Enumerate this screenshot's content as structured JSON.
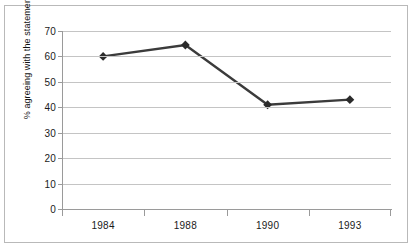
{
  "chart_data": {
    "type": "line",
    "title": "",
    "xlabel": "",
    "ylabel": "% agreeing with the statement.",
    "categories": [
      "1984",
      "1988",
      "1990",
      "1993"
    ],
    "values": [
      60,
      64.5,
      41,
      43
    ],
    "series": [
      {
        "name": "% agreeing with the statement.",
        "values": [
          60,
          64.5,
          41,
          43
        ]
      }
    ],
    "ylim": [
      0,
      70
    ],
    "y_ticks": [
      0,
      10,
      20,
      30,
      40,
      50,
      60,
      70
    ],
    "y_tick_labels": [
      "0",
      "10",
      "20",
      "30",
      "40",
      "50",
      "60",
      "70"
    ],
    "grid": "horizontal",
    "legend": "none",
    "marker": "diamond",
    "line_color": "#3b3b3b",
    "marker_color": "#2b2b2b",
    "gridline_color": "#c4c4c4",
    "axis_color": "#9a9a9a",
    "plot_background": "#ffffff",
    "border_color": "#b9b9b9"
  }
}
